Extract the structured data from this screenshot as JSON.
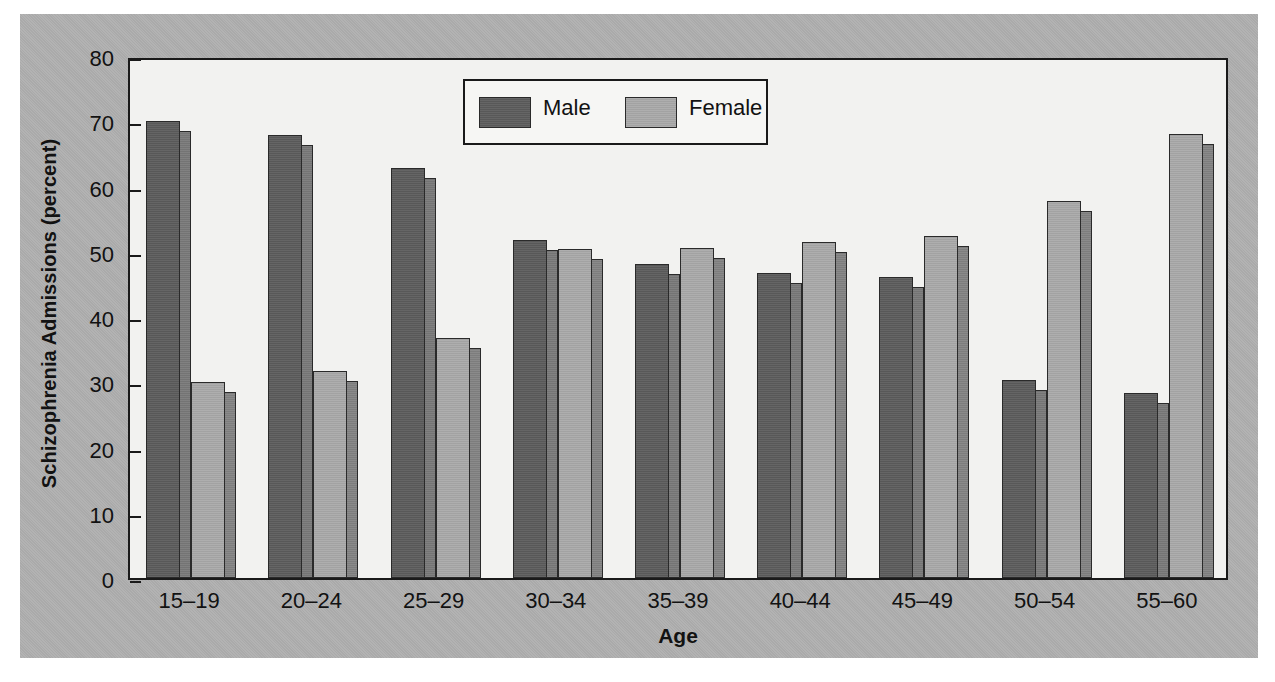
{
  "figure": {
    "background_color": "#ffffff",
    "panel_color": "#b0b0b0",
    "plot_background_color": "#f2f2f0"
  },
  "chart_data": {
    "type": "bar",
    "title": "",
    "subtitle": "",
    "xlabel": "Age",
    "ylabel": "Schizophrenia Admissions (percent)",
    "categories": [
      "15–19",
      "20–24",
      "25–29",
      "30–34",
      "35–39",
      "40–44",
      "45–49",
      "50–54",
      "55–60"
    ],
    "series": [
      {
        "name": "Male",
        "color": "#5d5d5d",
        "side_color": "#7a7a7a",
        "values": [
          70.0,
          67.9,
          62.8,
          51.8,
          48.1,
          46.7,
          46.2,
          30.4,
          28.3
        ]
      },
      {
        "name": "Female",
        "color": "#a9a9a9",
        "side_color": "#848484",
        "values": [
          30.0,
          31.8,
          36.8,
          50.5,
          50.6,
          51.5,
          52.4,
          57.8,
          68.0
        ]
      }
    ],
    "ylim": [
      0,
      80
    ],
    "yticks": [
      0,
      10,
      20,
      30,
      40,
      50,
      60,
      70,
      80
    ],
    "ytick_labels": [
      "0",
      "10",
      "20",
      "30",
      "40",
      "50",
      "60",
      "70",
      "80"
    ],
    "grid": false,
    "legend_position": "upper center",
    "legend_entries": [
      "Male",
      "Female"
    ],
    "bar_style": "3d-shaded"
  }
}
